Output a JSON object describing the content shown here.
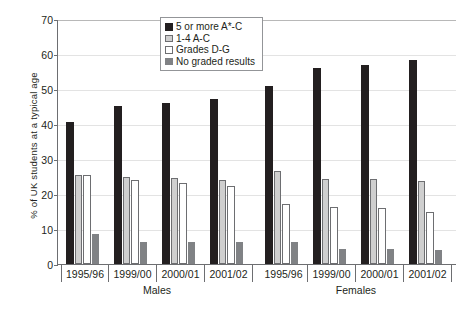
{
  "chart_data": {
    "type": "bar",
    "title": "",
    "xlabel": "",
    "ylabel": "% of UK students at a typical age",
    "ylim": [
      0,
      70
    ],
    "yticks": [
      0,
      10,
      20,
      30,
      40,
      50,
      60,
      70
    ],
    "grid": true,
    "legend_position": "top-center",
    "groups": [
      "Males",
      "Females"
    ],
    "categories": [
      "1995/96",
      "1999/00",
      "2000/01",
      "2001/02"
    ],
    "legend": [
      "5 or more A*-C",
      "1-4 A-C",
      "Grades D-G",
      "No graded results"
    ],
    "series": [
      {
        "name": "5 or more A*-C",
        "color": "#231f20",
        "values": {
          "Males": [
            40.6,
            45.1,
            46.0,
            47.1
          ],
          "Females": [
            50.9,
            56.0,
            56.9,
            58.3
          ]
        }
      },
      {
        "name": "1-4 A-C",
        "color": "#cfcfcf",
        "values": {
          "Males": [
            25.4,
            25.0,
            24.5,
            24.1
          ],
          "Females": [
            26.7,
            24.3,
            24.3,
            23.6
          ]
        }
      },
      {
        "name": "Grades D-G",
        "color": "#ffffff",
        "values": {
          "Males": [
            25.5,
            24.0,
            23.2,
            22.3
          ],
          "Females": [
            17.2,
            16.2,
            16.0,
            15.0
          ]
        }
      },
      {
        "name": "No graded results",
        "color": "#808285",
        "values": {
          "Males": [
            8.6,
            6.4,
            6.4,
            6.3
          ],
          "Females": [
            6.4,
            4.4,
            4.4,
            4.0
          ]
        }
      }
    ]
  },
  "axis": {
    "y_title": "% of UK students at a typical age",
    "y_ticks": [
      "70",
      "60",
      "50",
      "40",
      "30",
      "20",
      "10",
      "0"
    ]
  },
  "legend": {
    "items": [
      {
        "label": "5 or more A*-C"
      },
      {
        "label": "1-4 A-C"
      },
      {
        "label": "Grades D-G"
      },
      {
        "label": "No graded results"
      }
    ]
  },
  "x_axis": {
    "males": {
      "label": "Males",
      "ticks": [
        "1995/96",
        "1999/00",
        "2000/01",
        "2001/02"
      ]
    },
    "females": {
      "label": "Females",
      "ticks": [
        "1995/96",
        "1999/00",
        "2000/01",
        "2001/02"
      ]
    }
  },
  "source": {
    "text": ""
  }
}
